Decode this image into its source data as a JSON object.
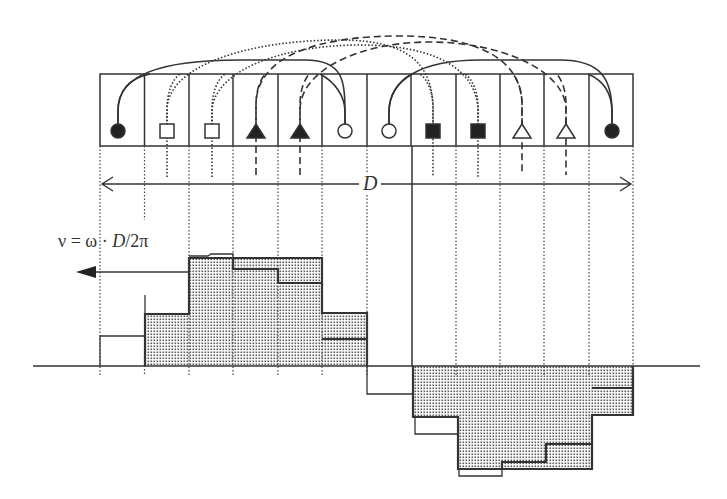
{
  "diagram": {
    "title": "",
    "strip": {
      "cell_count": 12,
      "cells": [
        {
          "index": 0,
          "symbol": "filled-circle"
        },
        {
          "index": 1,
          "symbol": "open-square"
        },
        {
          "index": 2,
          "symbol": "open-square"
        },
        {
          "index": 3,
          "symbol": "filled-triangle"
        },
        {
          "index": 4,
          "symbol": "filled-triangle"
        },
        {
          "index": 5,
          "symbol": "open-circle"
        },
        {
          "index": 6,
          "symbol": "open-circle"
        },
        {
          "index": 7,
          "symbol": "filled-square"
        },
        {
          "index": 8,
          "symbol": "filled-square"
        },
        {
          "index": 9,
          "symbol": "open-triangle"
        },
        {
          "index": 10,
          "symbol": "open-triangle"
        },
        {
          "index": 11,
          "symbol": "filled-circle"
        }
      ],
      "connections": [
        {
          "from": 0,
          "to": 11,
          "style": "solid"
        },
        {
          "from": 5,
          "to": 6,
          "style": "solid"
        },
        {
          "from": 1,
          "to": 7,
          "style": "dotted"
        },
        {
          "from": 2,
          "to": 8,
          "style": "dotted"
        },
        {
          "from": 3,
          "to": 9,
          "style": "dashed"
        },
        {
          "from": 4,
          "to": 10,
          "style": "dashed"
        }
      ]
    },
    "span_label": "D",
    "velocity_label": {
      "prefix": "ν = ω · ",
      "italic": "D",
      "suffix": "/2π"
    },
    "velocity_direction": "left",
    "upper_histogram": {
      "sign": "positive",
      "shaded_heights": [
        0,
        52,
        108,
        108,
        108,
        53
      ],
      "previous_heights": [
        30,
        52,
        111,
        97,
        83,
        27
      ]
    },
    "lower_histogram": {
      "sign": "negative",
      "shaded_depths": [
        51,
        103,
        103,
        103,
        49
      ],
      "previous_depths": [
        68,
        110,
        96,
        78,
        22
      ],
      "offset_step_depth": 28
    },
    "colors": {
      "line": "#333333",
      "fill_dot": "#555555",
      "background": "#ffffff"
    }
  }
}
